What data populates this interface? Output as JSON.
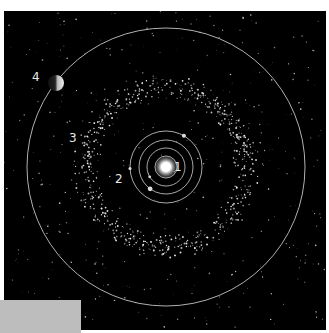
{
  "diagram": {
    "background_color": "#000000",
    "orbit_color": "#cfcfcf",
    "sun": {
      "cx": 162,
      "cy": 156,
      "r": 6,
      "color": "#ffffff"
    },
    "inner_orbits_radii": [
      11,
      19,
      27,
      36
    ],
    "asteroid_belt": {
      "inner_radius": 66,
      "outer_radius": 94
    },
    "outer_orbit_radius": 139,
    "outer_planet": {
      "cx": 52,
      "cy": 72,
      "r": 8
    },
    "labels": [
      {
        "id": "1",
        "text": "1",
        "x": 170,
        "y": 150
      },
      {
        "id": "2",
        "text": "2",
        "x": 111,
        "y": 162
      },
      {
        "id": "3",
        "text": "3",
        "x": 65,
        "y": 121
      },
      {
        "id": "4",
        "text": "4",
        "x": 28,
        "y": 60
      }
    ]
  },
  "overlay": {
    "gray_box_color": "#bdbdbd"
  }
}
